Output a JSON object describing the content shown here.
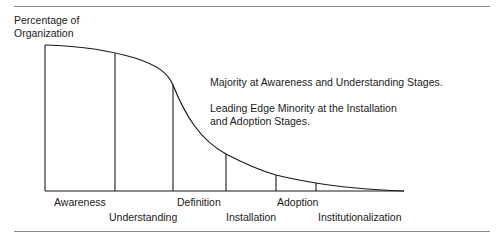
{
  "figure": {
    "y_axis_label_line1": "Percentage of",
    "y_axis_label_line2": "Organization",
    "annotation_1": "Majority at Awareness and Understanding Stages.",
    "annotation_2_line1": "Leading Edge Minority at the Installation",
    "annotation_2_line2": "and Adoption Stages.",
    "stages": [
      {
        "label": "Awareness"
      },
      {
        "label": "Understanding"
      },
      {
        "label": "Definition"
      },
      {
        "label": "Installation"
      },
      {
        "label": "Adoption"
      },
      {
        "label": "Institutionalization"
      }
    ],
    "colors": {
      "line": "#1a1a1a",
      "rule": "#8a8a8a"
    }
  }
}
